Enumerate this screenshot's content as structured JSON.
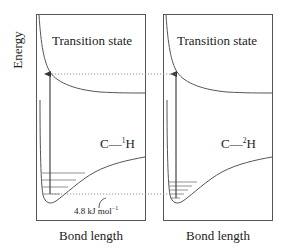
{
  "diagram": {
    "y_axis_label": "Energy",
    "panels": [
      {
        "id": "protium",
        "title": "Transition state",
        "bond_label_prefix": "C—",
        "isotope_superscript": "1",
        "bond_label_atom": "H",
        "x_axis_label": "Bond length",
        "vibrational_levels": 4
      },
      {
        "id": "deuterium",
        "title": "Transition state",
        "bond_label_prefix": "C—",
        "isotope_superscript": "2",
        "bond_label_atom": "H",
        "x_axis_label": "Bond length",
        "vibrational_levels": 5
      }
    ],
    "annotation": {
      "value": "4.8 kJ mol",
      "unit_superscript": "−1"
    }
  }
}
